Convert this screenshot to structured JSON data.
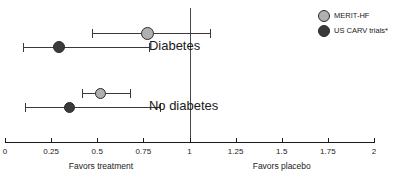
{
  "chart_data": {
    "type": "scatter",
    "subtype": "forest-plot",
    "title": "",
    "xlabel": "",
    "ylabel": "",
    "xlim": [
      0,
      2
    ],
    "grid": false,
    "null_value": 1,
    "tick_values": [
      0,
      0.25,
      0.5,
      0.75,
      1,
      1.25,
      1.5,
      1.75,
      2
    ],
    "tick_labels": [
      "0",
      "0.25",
      "0.5",
      "0.75",
      "1",
      "1.25",
      "1.5",
      "1.75",
      "2"
    ],
    "axis_annotations": [
      {
        "text": "Favors treatment",
        "x": 0.52
      },
      {
        "text": "Favors placebo",
        "x": 1.5
      }
    ],
    "legend": {
      "position": "top-right",
      "entries": [
        {
          "name": "MERIT-HF",
          "color": "#b0b0b0"
        },
        {
          "name": "US CARV trials*",
          "color": "#3a3a3a"
        }
      ]
    },
    "groups": [
      {
        "label": "Diabetes",
        "label_x": 0.78,
        "points": [
          {
            "series": "MERIT-HF",
            "estimate": 0.77,
            "ci_low": 0.47,
            "ci_high": 1.11,
            "color": "#b0b0b0",
            "marker_size": 13
          },
          {
            "series": "US CARV trials*",
            "estimate": 0.29,
            "ci_low": 0.1,
            "ci_high": 0.78,
            "color": "#3a3a3a",
            "marker_size": 12
          }
        ]
      },
      {
        "label": "No diabetes",
        "label_x": 0.78,
        "points": [
          {
            "series": "MERIT-HF",
            "estimate": 0.52,
            "ci_low": 0.42,
            "ci_high": 0.68,
            "color": "#b0b0b0",
            "marker_size": 11
          },
          {
            "series": "US CARV trials*",
            "estimate": 0.35,
            "ci_low": 0.11,
            "ci_high": 0.84,
            "color": "#3a3a3a",
            "marker_size": 11
          }
        ]
      }
    ]
  },
  "geometry": {
    "axis_left_px": 5,
    "axis_right_px": 374,
    "row_y_px": [
      33,
      47,
      93,
      107
    ],
    "group_label_y_px": [
      38,
      98
    ]
  }
}
